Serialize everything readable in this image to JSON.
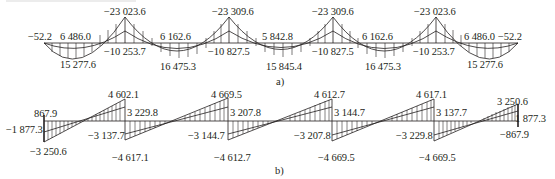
{
  "header": {
    "text": ""
  },
  "diagram_a": {
    "caption": "a)",
    "title": "Bending moment diagram",
    "labels": {
      "end_left": "−52.2",
      "end_right": "−52.2",
      "span1_inner": "6 486.0",
      "span1_outer": "15 277.6",
      "support2_outer": "−23 023.6",
      "support2_inner": "−10 253.7",
      "span2_inner": "6 162.6",
      "span2_outer": "16 475.3",
      "support3_outer": "−23 309.6",
      "support3_inner": "−10 827.5",
      "span3_inner": "5 842.8",
      "span3_outer": "15 845.4",
      "support4_outer": "−23 309.6",
      "support4_inner": "−10 827.5",
      "span4_inner": "6 162.6",
      "span4_outer": "16 475.3",
      "support5_outer": "−23 023.6",
      "support5_inner": "−10 253.7",
      "span5_inner": "6 486.0",
      "span5_outer": "15 277.6"
    }
  },
  "diagram_b": {
    "caption": "b)",
    "title": "Shear force diagram",
    "labels": {
      "left_end_top": "867.9",
      "left_end_mid": "−1 877.3",
      "left_end_bottom": "−3 250.6",
      "j1_top_outer": "4 602.1",
      "j1_top_inner": "3 229.8",
      "j1_bottom_inner": "−3 137.7",
      "j1_bottom_outer": "−4 617.1",
      "j2_top_outer": "4 669.5",
      "j2_top_inner": "3 207.8",
      "j2_bottom_inner": "−3 144.7",
      "j2_bottom_outer": "−4 612.7",
      "j3_top_outer": "4 612.7",
      "j3_top_inner": "3 144.7",
      "j3_bottom_inner": "−3 207.8",
      "j3_bottom_outer": "−4 669.5",
      "j4_top_outer": "4 617.1",
      "j4_top_inner": "3 137.7",
      "j4_bottom_inner": "−3 229.8",
      "j4_bottom_outer": "−4 669.5",
      "right_end_top": "3 250.6",
      "right_end_mid": "1 877.3",
      "right_end_bottom": "−867.9"
    }
  },
  "colors": {
    "ink": "#231f20",
    "background": "#ffffff"
  }
}
